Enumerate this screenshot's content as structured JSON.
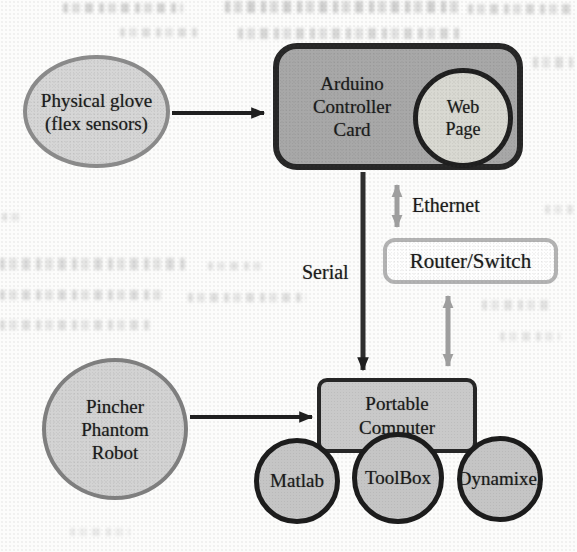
{
  "figure": {
    "nodes": {
      "glove": {
        "lines": [
          "Physical glove",
          "(flex sensors)"
        ]
      },
      "arduino": {
        "lines": [
          "Arduino",
          "Controller",
          "Card"
        ]
      },
      "web_page": {
        "lines": [
          "Web",
          "Page"
        ]
      },
      "router": {
        "label": "Router/Switch"
      },
      "computer": {
        "lines": [
          "Portable",
          "Computer"
        ]
      },
      "robot": {
        "lines": [
          "Pincher",
          "Phantom",
          "Robot"
        ]
      },
      "matlab": {
        "label": "Matlab"
      },
      "toolbox": {
        "label": "ToolBox"
      },
      "dynamixel": {
        "label": "Dynamixel"
      }
    },
    "edge_labels": {
      "serial": "Serial",
      "ethernet": "Ethernet"
    },
    "colors": {
      "node_fill_light": "#d6d6d6",
      "node_fill_medium": "#a8a8a8",
      "computer_fill": "#c9c9c9",
      "webpage_fill": "#d9d9d2",
      "border_dark": "#262626",
      "border_gray": "#8b8b8b",
      "router_border": "#b3b3b3",
      "arrow_black": "#1f1f1f",
      "arrow_gray": "#9e9e9e"
    }
  }
}
